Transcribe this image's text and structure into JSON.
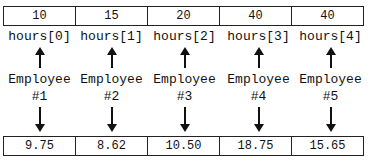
{
  "hours_array": {
    "values": [
      "10",
      "15",
      "20",
      "40",
      "40"
    ],
    "labels": [
      "hours[0]",
      "hours[1]",
      "hours[2]",
      "hours[3]",
      "hours[4]"
    ]
  },
  "employees": [
    {
      "line1": "Employee",
      "line2": "#1"
    },
    {
      "line1": "Employee",
      "line2": "#2"
    },
    {
      "line1": "Employee",
      "line2": "#3"
    },
    {
      "line1": "Employee",
      "line2": "#4"
    },
    {
      "line1": "Employee",
      "line2": "#5"
    }
  ],
  "pay_rate_array": {
    "values": [
      "9.75",
      "8.62",
      "10.50",
      "18.75",
      "15.65"
    ]
  }
}
